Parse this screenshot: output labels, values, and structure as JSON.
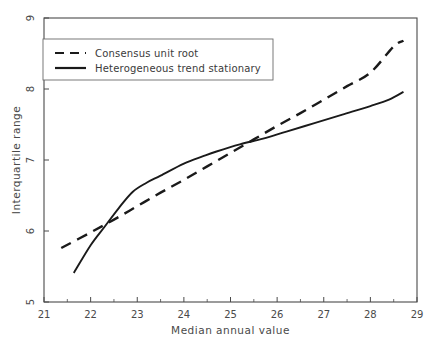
{
  "chart_data": {
    "type": "line",
    "title": "",
    "xlabel": "Median annual value",
    "ylabel": "Interquartile range",
    "xlim": [
      21,
      29
    ],
    "ylim": [
      5,
      9
    ],
    "xticks": [
      "21",
      "22",
      "23",
      "24",
      "25",
      "26",
      "27",
      "28",
      "29"
    ],
    "yticks": [
      "5",
      "6",
      "7",
      "8",
      "9"
    ],
    "grid": false,
    "legend_position": "upper-left",
    "series": [
      {
        "name": "Consensus unit root",
        "style": "dashed",
        "color": "#1a1a1a",
        "x": [
          21.37,
          22.0,
          22.5,
          23.0,
          23.5,
          24.0,
          24.5,
          25.0,
          25.5,
          26.0,
          26.5,
          27.0,
          27.5,
          28.0,
          28.5,
          28.71
        ],
        "y": [
          5.76,
          5.98,
          6.16,
          6.35,
          6.54,
          6.72,
          6.91,
          7.1,
          7.29,
          7.48,
          7.66,
          7.85,
          8.04,
          8.23,
          8.6,
          8.68
        ]
      },
      {
        "name": "Heterogeneous trend stationary",
        "style": "solid",
        "color": "#1a1a1a",
        "x": [
          21.64,
          22.0,
          22.3,
          22.6,
          22.9,
          23.2,
          23.5,
          24.0,
          24.4,
          24.7,
          25.2,
          25.7,
          26.2,
          26.8,
          27.4,
          28.0,
          28.4,
          28.71
        ],
        "y": [
          5.41,
          5.8,
          6.06,
          6.32,
          6.55,
          6.68,
          6.78,
          6.95,
          7.05,
          7.12,
          7.22,
          7.3,
          7.4,
          7.52,
          7.64,
          7.76,
          7.85,
          7.96
        ]
      }
    ]
  },
  "legend": {
    "entries": [
      {
        "label": "Consensus unit root",
        "style": "dashed"
      },
      {
        "label": "Heterogeneous trend stationary",
        "style": "solid"
      }
    ]
  },
  "axes": {
    "x_title": "Median annual value",
    "y_title": "Interquartile range",
    "x_tick_labels": [
      "21",
      "22",
      "23",
      "24",
      "25",
      "26",
      "27",
      "28",
      "29"
    ],
    "y_tick_labels": [
      "5",
      "6",
      "7",
      "8",
      "9"
    ]
  },
  "colors": {
    "axis": "#4a4a4a",
    "line": "#1a1a1a",
    "background": "#ffffff",
    "legend_border": "#6a6a6a"
  }
}
